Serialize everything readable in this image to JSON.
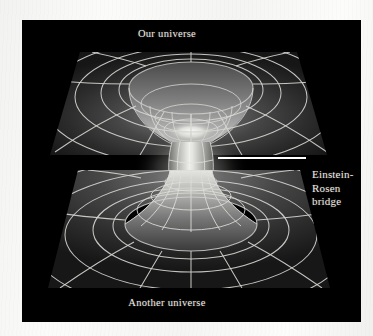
{
  "figure": {
    "title_top": "Our universe",
    "title_bottom": "Another universe",
    "annotation": {
      "line1": "Einstein-",
      "line2": "Rosen",
      "line3": "bridge"
    }
  },
  "colors": {
    "panel_background": "#000000",
    "page_background": "#f6f6f4",
    "text": "#f0ece4",
    "grid_line": "#d8d8d4",
    "leader_line": "#ffffff",
    "sheet_dark": "#1d1d1d",
    "sheet_mid": "#3c3c3c",
    "throat_glow": "#f4f4f0"
  },
  "diagram": {
    "type": "wormhole-embedding-diagram",
    "upper_sheet_label": "Our universe",
    "lower_sheet_label": "Another universe",
    "throat_label": "Einstein-Rosen bridge"
  }
}
